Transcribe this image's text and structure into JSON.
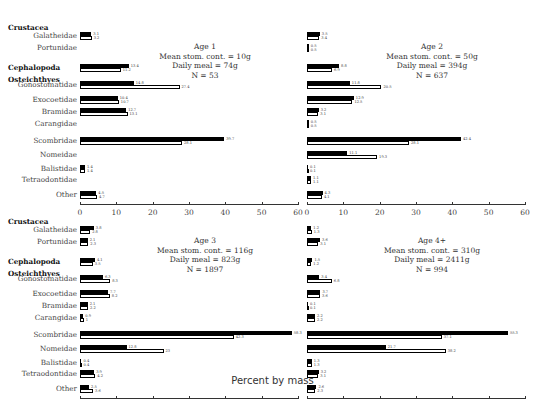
{
  "chart_data": {
    "type": "bar",
    "orientation": "horizontal",
    "xlabel": "Percent by mass",
    "xlim": [
      0,
      60
    ],
    "xticks": [
      0,
      10,
      20,
      30,
      40,
      50,
      60
    ],
    "groups": [
      {
        "name": "Crustacea",
        "categories": [
          "Galatheidae",
          "Portunidae"
        ]
      },
      {
        "name": "Cephalopoda",
        "categories": [
          "Cephalopoda"
        ]
      },
      {
        "name": "Osteichthyes",
        "categories": [
          "Gonostomatidae",
          "Exocoetidae",
          "Bramidae",
          "Carangidae",
          "Scombridae",
          "Nomeidae",
          "Balistidae",
          "Tetraodontidae",
          "Other"
        ]
      }
    ],
    "categories": [
      "Galatheidae",
      "Portunidae",
      "Cephalopoda",
      "Gonostomatidae",
      "Exocoetidae",
      "Bramidae",
      "Carangidae",
      "Scombridae",
      "Nomeidae",
      "Balistidae",
      "Tetraodontidae",
      "Other"
    ],
    "series_legend": {
      "black": "filled bar",
      "white": "open bar"
    },
    "panels": [
      {
        "title": "Age 1",
        "stats": [
          "Mean stom. cont. = 10g",
          "Daily meal = 74g",
          "N = 53"
        ],
        "black": [
          3.1,
          null,
          13.4,
          14.8,
          10.4,
          12.7,
          null,
          39.7,
          null,
          1.4,
          null,
          4.5
        ],
        "white": [
          3.2,
          null,
          11.2,
          27.4,
          10.7,
          13.1,
          null,
          28.1,
          null,
          1.4,
          null,
          4.7
        ]
      },
      {
        "title": "Age 2",
        "stats": [
          "Mean stom. cont. = 50g",
          "Daily meal = 394g",
          "N = 637"
        ],
        "black": [
          3.5,
          0.5,
          8.8,
          11.8,
          12.9,
          3.2,
          0.5,
          42.4,
          11.1,
          0.1,
          1.1,
          4.3
        ],
        "white": [
          3.4,
          0.5,
          6.9,
          20.5,
          12.5,
          3.1,
          0.5,
          28.1,
          19.3,
          0.1,
          1.1,
          4.1
        ]
      },
      {
        "title": "Age 3",
        "stats": [
          "Mean stom. cont. = 116g",
          "Daily meal = 823g",
          "N = 1897"
        ],
        "black": [
          3.8,
          2.1,
          4.1,
          6.3,
          7.7,
          2.1,
          0.9,
          58.3,
          12.8,
          0.4,
          3.9,
          2.5
        ],
        "white": [
          2.8,
          2.3,
          3.5,
          8.3,
          8.2,
          2.2,
          1.0,
          42.3,
          23.0,
          0.4,
          4.2,
          3.6
        ]
      },
      {
        "title": "Age 4+",
        "stats": [
          "Mean stom. cont. = 310g",
          "Daily meal = 2411g",
          "N = 994"
        ],
        "black": [
          1.2,
          3.6,
          1.5,
          3.4,
          3.7,
          0.1,
          2.2,
          55.3,
          21.7,
          1.3,
          3.2,
          2.6
        ],
        "white": [
          1.3,
          3.1,
          1.2,
          6.8,
          3.6,
          0.1,
          2.2,
          37.1,
          38.2,
          1.3,
          3.1,
          2.3
        ]
      }
    ]
  }
}
